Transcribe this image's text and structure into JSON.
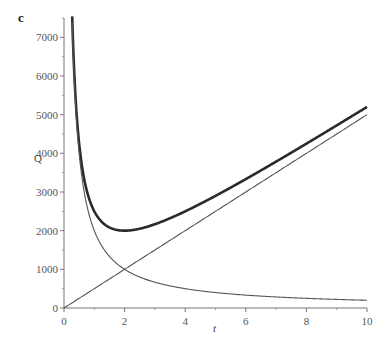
{
  "chart_data": {
    "type": "line",
    "title": "",
    "panel_label": "c",
    "xlabel": "t",
    "ylabel": "Q",
    "xlim": [
      0,
      10
    ],
    "ylim": [
      0,
      7500
    ],
    "x_ticks": [
      0,
      2,
      4,
      6,
      8,
      10
    ],
    "y_ticks": [
      0,
      1000,
      2000,
      3000,
      4000,
      5000,
      6000,
      7000
    ],
    "grid": false,
    "legend": null,
    "series": [
      {
        "name": "Q = 2000/t + 500t (total)",
        "style": "thick",
        "x": [
          0.27,
          0.3,
          0.4,
          0.5,
          0.75,
          1,
          1.5,
          2,
          3,
          4,
          5,
          6,
          7,
          8,
          9,
          10
        ],
        "values": [
          7542,
          6817,
          5200,
          4250,
          3042,
          2500,
          2083,
          2000,
          2167,
          2500,
          2900,
          3333,
          3786,
          4250,
          4722,
          5200
        ]
      },
      {
        "name": "2000/t",
        "style": "thin",
        "x": [
          0.27,
          0.3,
          0.4,
          0.5,
          0.75,
          1,
          1.5,
          2,
          3,
          4,
          5,
          6,
          7,
          8,
          9,
          10
        ],
        "values": [
          7407,
          6667,
          5000,
          4000,
          2667,
          2000,
          1333,
          1000,
          667,
          500,
          400,
          333,
          286,
          250,
          222,
          200
        ]
      },
      {
        "name": "500t",
        "style": "thin",
        "x": [
          0,
          10
        ],
        "values": [
          0,
          5000
        ]
      }
    ],
    "annotations": [
      "minimum of total at t = 2, Q = 2000",
      "curves cross at t = 2, Q = 1000"
    ]
  }
}
